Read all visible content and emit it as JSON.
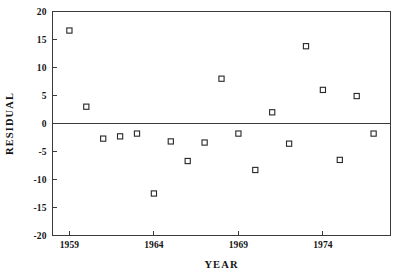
{
  "chart_data": {
    "type": "scatter",
    "title": "",
    "xlabel": "YEAR",
    "ylabel": "RESIDUAL",
    "xlim": [
      1958,
      1978
    ],
    "ylim": [
      -20,
      20
    ],
    "grid": false,
    "legend": "none",
    "marker": "open-square",
    "x_ticks": [
      1959,
      1964,
      1969,
      1974
    ],
    "x_tick_labels": [
      "1959",
      "1964",
      "1969",
      "1974"
    ],
    "y_ticks": [
      20,
      15,
      10,
      5,
      0,
      -5,
      -10,
      -15,
      -20
    ],
    "y_tick_labels": [
      "20",
      "15",
      "10",
      "5",
      "0",
      "-5",
      "-10",
      "-15",
      "-20"
    ],
    "reference_lines": [
      {
        "axis": "y",
        "value": 0
      }
    ],
    "x": [
      1959,
      1960,
      1961,
      1962,
      1963,
      1964,
      1965,
      1966,
      1967,
      1968,
      1969,
      1970,
      1971,
      1972,
      1973,
      1974,
      1975,
      1976,
      1977
    ],
    "values": [
      16.6,
      3.0,
      -2.7,
      -2.3,
      -1.8,
      -12.5,
      -3.2,
      -6.7,
      -3.4,
      8.0,
      -1.8,
      -8.3,
      2.0,
      -3.6,
      13.8,
      6.0,
      -6.5,
      4.9,
      -1.8
    ],
    "points": [
      {
        "year": 1959,
        "residual": 16.6
      },
      {
        "year": 1960,
        "residual": 3.0
      },
      {
        "year": 1961,
        "residual": -2.7
      },
      {
        "year": 1962,
        "residual": -2.3
      },
      {
        "year": 1963,
        "residual": -1.8
      },
      {
        "year": 1964,
        "residual": -12.5
      },
      {
        "year": 1965,
        "residual": -3.2
      },
      {
        "year": 1966,
        "residual": -6.7
      },
      {
        "year": 1967,
        "residual": -3.4
      },
      {
        "year": 1968,
        "residual": 8.0
      },
      {
        "year": 1969,
        "residual": -1.8
      },
      {
        "year": 1970,
        "residual": -8.3
      },
      {
        "year": 1971,
        "residual": 2.0
      },
      {
        "year": 1972,
        "residual": -3.6
      },
      {
        "year": 1973,
        "residual": 13.8
      },
      {
        "year": 1974,
        "residual": 6.0
      },
      {
        "year": 1975,
        "residual": -6.5
      },
      {
        "year": 1976,
        "residual": 4.9
      },
      {
        "year": 1977,
        "residual": -1.8
      }
    ]
  },
  "colors": {
    "axis": "#3a3a3a",
    "marker_stroke": "#262626",
    "marker_fill": "#ffffff",
    "text": "#141414",
    "background": "#ffffff"
  }
}
